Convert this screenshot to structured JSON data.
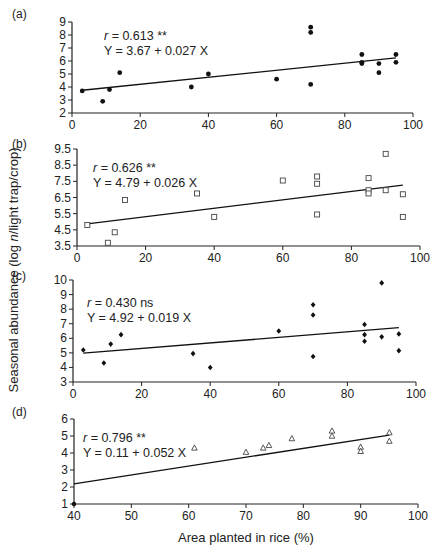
{
  "figure": {
    "ylabel_prefix": "Seasonal abundance (log ",
    "ylabel_italic": "n",
    "ylabel_suffix": "/light trap/crop)",
    "xlabel": "Area planted in rice (%)"
  },
  "chart_data": [
    {
      "type": "scatter",
      "panel": "(a)",
      "title": "",
      "xlabel": "",
      "ylabel": "",
      "xlim": [
        0,
        100
      ],
      "ylim": [
        2,
        9
      ],
      "xticks": [
        0,
        20,
        40,
        60,
        80,
        100
      ],
      "yticks": [
        2,
        3,
        4,
        5,
        6,
        7,
        8,
        9
      ],
      "marker": "filled-circle",
      "annotation": {
        "r_label": "r",
        "r_text": " = 0.613 **",
        "equation": "Y = 3.67 + 0.027 X"
      },
      "regression": {
        "intercept": 3.67,
        "slope": 0.027,
        "x_from": 3,
        "x_to": 95
      },
      "points": [
        [
          3,
          3.7
        ],
        [
          9,
          2.9
        ],
        [
          11,
          3.8
        ],
        [
          14,
          5.1
        ],
        [
          35,
          4.0
        ],
        [
          40,
          5.0
        ],
        [
          60,
          4.6
        ],
        [
          70,
          8.6
        ],
        [
          70,
          8.2
        ],
        [
          70,
          4.2
        ],
        [
          85,
          6.5
        ],
        [
          85,
          5.9
        ],
        [
          85,
          5.8
        ],
        [
          90,
          5.8
        ],
        [
          90,
          5.1
        ],
        [
          95,
          6.5
        ],
        [
          95,
          5.9
        ]
      ],
      "grid": false
    },
    {
      "type": "scatter",
      "panel": "(b)",
      "title": "",
      "xlabel": "",
      "ylabel": "",
      "xlim": [
        0,
        100
      ],
      "ylim": [
        3.5,
        9.5
      ],
      "xticks": [
        0,
        20,
        40,
        60,
        80,
        100
      ],
      "yticks": [
        3.5,
        4.5,
        5.5,
        6.5,
        7.5,
        8.5,
        9.5
      ],
      "marker": "open-square",
      "annotation": {
        "r_label": "r",
        "r_text": " = 0.626 **",
        "equation": "Y = 4.79 + 0.026 X"
      },
      "regression": {
        "intercept": 4.79,
        "slope": 0.026,
        "x_from": 3,
        "x_to": 95
      },
      "points": [
        [
          3,
          4.8
        ],
        [
          9,
          3.7
        ],
        [
          11,
          4.35
        ],
        [
          14,
          6.35
        ],
        [
          35,
          6.75
        ],
        [
          40,
          5.3
        ],
        [
          60,
          7.55
        ],
        [
          70,
          7.8
        ],
        [
          70,
          7.35
        ],
        [
          70,
          5.45
        ],
        [
          85,
          7.7
        ],
        [
          85,
          6.95
        ],
        [
          85,
          6.75
        ],
        [
          90,
          9.2
        ],
        [
          90,
          6.95
        ],
        [
          95,
          6.7
        ],
        [
          95,
          5.3
        ]
      ],
      "grid": false
    },
    {
      "type": "scatter",
      "panel": "(c)",
      "title": "",
      "xlabel": "",
      "ylabel": "Seasonal abundance (log n/light trap/crop)",
      "xlim": [
        0,
        100
      ],
      "ylim": [
        3,
        10
      ],
      "xticks": [
        0,
        20,
        40,
        60,
        80,
        100
      ],
      "yticks": [
        3,
        4,
        5,
        6,
        7,
        8,
        9,
        10
      ],
      "marker": "filled-diamond",
      "annotation": {
        "r_label": "r",
        "r_text": " = 0.430 ns",
        "equation": "Y = 4.92 + 0.019 X"
      },
      "regression": {
        "intercept": 4.92,
        "slope": 0.019,
        "x_from": 3,
        "x_to": 95
      },
      "points": [
        [
          3,
          5.2
        ],
        [
          9,
          4.3
        ],
        [
          11,
          5.6
        ],
        [
          14,
          6.25
        ],
        [
          35,
          4.95
        ],
        [
          40,
          4.0
        ],
        [
          60,
          6.5
        ],
        [
          70,
          8.3
        ],
        [
          70,
          7.6
        ],
        [
          70,
          4.75
        ],
        [
          85,
          6.95
        ],
        [
          85,
          6.25
        ],
        [
          85,
          5.8
        ],
        [
          90,
          9.8
        ],
        [
          90,
          6.1
        ],
        [
          95,
          6.3
        ],
        [
          95,
          5.15
        ]
      ],
      "grid": false
    },
    {
      "type": "scatter",
      "panel": "(d)",
      "title": "",
      "xlabel": "Area planted in rice (%)",
      "ylabel": "",
      "xlim": [
        40,
        100
      ],
      "ylim": [
        1,
        6
      ],
      "xticks": [
        40,
        50,
        60,
        70,
        80,
        90,
        100
      ],
      "yticks": [
        1,
        2,
        3,
        4,
        5,
        6
      ],
      "marker": "open-triangle",
      "annotation": {
        "r_label": "r",
        "r_text": " = 0.796 **",
        "equation": "Y = 0.11 + 0.052 X"
      },
      "regression": {
        "intercept": 0.11,
        "slope": 0.052,
        "x_from": 40,
        "x_to": 95
      },
      "points": [
        [
          61,
          4.3
        ],
        [
          70,
          4.05
        ],
        [
          73,
          4.3
        ],
        [
          74,
          4.45
        ],
        [
          78,
          4.85
        ],
        [
          85,
          5.3
        ],
        [
          85,
          5.0
        ],
        [
          90,
          4.35
        ],
        [
          90,
          4.1
        ],
        [
          95,
          5.2
        ],
        [
          95,
          4.7
        ]
      ],
      "origin_dot": [
        40,
        1
      ],
      "grid": false
    }
  ]
}
